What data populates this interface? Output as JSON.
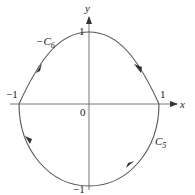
{
  "figure": {
    "type": "contour-diagram",
    "axes": {
      "x_label": "x",
      "y_label": "y",
      "origin_label": "0",
      "tick_labels": {
        "x_neg": "−1",
        "x_pos": "1",
        "y_pos": "1",
        "y_neg": "−1"
      }
    },
    "curves": [
      {
        "id": "upper",
        "label_prefix": "−C",
        "label_sub": "6",
        "shape": "parabolic arc through (-1,0), (0,1), (1,0)",
        "arrows": [
          "down-right on right half",
          "down-left on left half"
        ]
      },
      {
        "id": "lower",
        "label_prefix": "C",
        "label_sub": "5",
        "shape": "semicircle through (-1,0), (0,-1), (1,0)",
        "arrows": [
          "down on left half",
          "up-right on right half"
        ]
      }
    ],
    "colors": {
      "curve": "#555555",
      "axis": "#666666",
      "text": "#222222"
    }
  }
}
